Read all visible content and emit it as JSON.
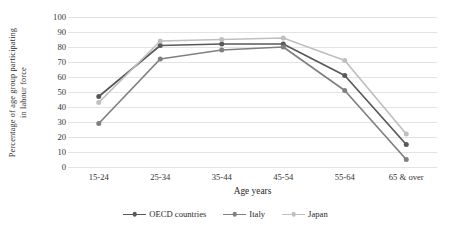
{
  "chart_data": {
    "type": "line",
    "title": "",
    "xlabel": "Age years",
    "ylabel": "Percentage of age group participating in labour force",
    "ylabel_line1": "Percentage of  age group participating",
    "ylabel_line2": "in labour force",
    "categories": [
      "15-24",
      "25-34",
      "35-44",
      "45-54",
      "55-64",
      "65 & over"
    ],
    "ylim": [
      0,
      100
    ],
    "ytick_step": 10,
    "yticks": [
      "100",
      "90",
      "80",
      "70",
      "60",
      "50",
      "40",
      "30",
      "20",
      "10",
      "0"
    ],
    "grid": true,
    "legend_position": "bottom",
    "series": [
      {
        "name": "OECD countries",
        "color": "#595959",
        "values": [
          47,
          81,
          82,
          82,
          61,
          15
        ]
      },
      {
        "name": "Italy",
        "color": "#808080",
        "values": [
          29,
          72,
          78,
          80,
          51,
          5
        ]
      },
      {
        "name": "Japan",
        "color": "#bfbfbf",
        "values": [
          43,
          84,
          85,
          86,
          71,
          22
        ]
      }
    ]
  },
  "legend": {
    "items": [
      {
        "label": "OECD countries"
      },
      {
        "label": "Italy"
      },
      {
        "label": "Japan"
      }
    ]
  }
}
